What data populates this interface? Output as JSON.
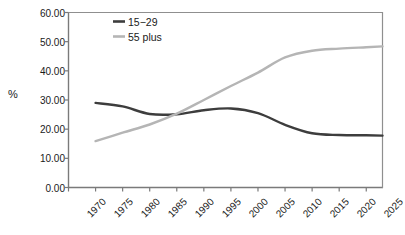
{
  "chart_data": {
    "type": "line",
    "title": "",
    "xlabel": "",
    "ylabel": "%",
    "xlim": [
      1970,
      2028
    ],
    "ylim": [
      0,
      60
    ],
    "grid": false,
    "legend_position": "top-left-inside",
    "x_tick_labels": [
      "1970",
      "1975",
      "1980",
      "1985",
      "1990",
      "1995",
      "2000",
      "2005",
      "2010",
      "2015",
      "2020",
      "2025"
    ],
    "x_tick_values": [
      1970,
      1975,
      1980,
      1985,
      1990,
      1995,
      2000,
      2005,
      2010,
      2015,
      2020,
      2025
    ],
    "y_tick_labels": [
      "0.00",
      "10.00",
      "20.00",
      "30.00",
      "40.00",
      "50.00",
      "60.00"
    ],
    "y_tick_values": [
      0,
      10,
      20,
      30,
      40,
      50,
      60
    ],
    "x": [
      1975,
      1980,
      1985,
      1990,
      1995,
      2000,
      2005,
      2010,
      2015,
      2020,
      2025,
      2028
    ],
    "series": [
      {
        "name": "15−29",
        "color": "#3d3d3d",
        "values": [
          29.0,
          27.8,
          25.2,
          25.1,
          26.5,
          27.1,
          25.5,
          21.5,
          18.6,
          18.0,
          17.9,
          17.8
        ]
      },
      {
        "name": "55 plus",
        "color": "#b5b5b5",
        "values": [
          15.9,
          18.8,
          21.6,
          25.3,
          30.0,
          34.8,
          39.4,
          44.6,
          46.9,
          47.6,
          48.1,
          48.4
        ]
      }
    ]
  },
  "legend": {
    "items": [
      {
        "label": "15−29",
        "color": "#3d3d3d"
      },
      {
        "label": "55 plus",
        "color": "#b5b5b5"
      }
    ]
  },
  "axes": {
    "y_axis_title": "%"
  }
}
